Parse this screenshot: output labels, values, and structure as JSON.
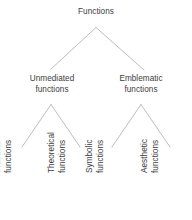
{
  "diagram": {
    "type": "hierarchy-tree",
    "background_color": "#ffffff",
    "text_color": "#3c3c3c",
    "line_color": "#b5b5b5",
    "root": {
      "label": "Functions"
    },
    "level2": [
      {
        "label": "Unmediated\nfunctions"
      },
      {
        "label": "Emblematic\nfunctions"
      }
    ],
    "level3": [
      {
        "label": "Practical\nfunctions"
      },
      {
        "label": "Theoretical\nfunctions"
      },
      {
        "label": "Symbolic\nfunctions"
      },
      {
        "label": "Aesthetic\nfunctions"
      }
    ]
  }
}
